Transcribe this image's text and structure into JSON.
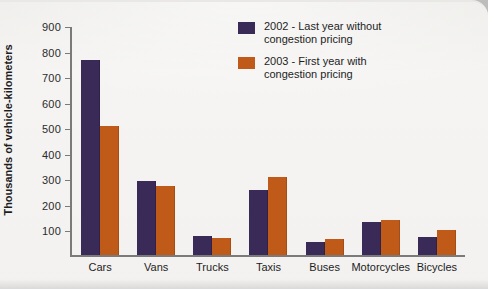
{
  "chart_data": {
    "type": "bar",
    "title": "",
    "xlabel": "",
    "ylabel": "Thousands of vehicle-kilometers",
    "ylim": [
      0,
      900
    ],
    "yticks": [
      100,
      200,
      300,
      400,
      500,
      600,
      700,
      800,
      900
    ],
    "grid": false,
    "legend_position": "top-right",
    "categories": [
      "Cars",
      "Vans",
      "Trucks",
      "Taxis",
      "Buses",
      "Motorcycles",
      "Bicycles"
    ],
    "series": [
      {
        "name": "2002 - Last year without congestion pricing",
        "color": "#3a2a58",
        "values": [
          765,
          288,
          73,
          254,
          50,
          131,
          69
        ]
      },
      {
        "name": "2003 - First year with congestion pricing",
        "color": "#bf5a19",
        "values": [
          504,
          269,
          65,
          304,
          62,
          138,
          96
        ]
      }
    ]
  },
  "legend": {
    "entries": [
      {
        "line1": "2002 - Last year without",
        "line2": "congestion pricing"
      },
      {
        "line1": "2003 - First year with",
        "line2": "congestion pricing"
      }
    ]
  },
  "colors": {
    "series_a": "#3a2a58",
    "series_b": "#bf5a19",
    "axis": "#7a7a7a",
    "page": "#f2f1ef",
    "backdrop": "#bdbdbd"
  }
}
